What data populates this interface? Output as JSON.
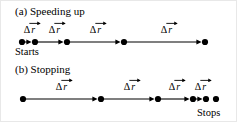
{
  "figure": {
    "width": 237,
    "height": 122,
    "background": "#ffffff",
    "stroke_color": "#000000"
  },
  "panels": [
    {
      "id": "speeding-up",
      "title": "(a) Speeding up",
      "title_x": 14,
      "title_y": 5,
      "baseline_y": 41,
      "endpoint_label": "Starts",
      "endpoint_label_x": 14,
      "endpoint_label_y": 46,
      "dots_x": [
        21,
        34,
        66,
        123,
        204
      ],
      "segments": [
        {
          "label": "Δ",
          "symbol": "r",
          "x_start": 21,
          "x_end": 34,
          "label_x": 29,
          "label_y": 24
        },
        {
          "label": "Δ",
          "symbol": "r",
          "x_start": 34,
          "x_end": 66,
          "label_x": 54,
          "label_y": 24
        },
        {
          "label": "Δ",
          "symbol": "r",
          "x_start": 66,
          "x_end": 123,
          "label_x": 95,
          "label_y": 24
        },
        {
          "label": "Δ",
          "symbol": "r",
          "x_start": 123,
          "x_end": 204,
          "label_x": 166,
          "label_y": 24
        }
      ]
    },
    {
      "id": "stopping",
      "title": "(b) Stopping",
      "title_x": 14,
      "title_y": 63,
      "baseline_y": 98,
      "endpoint_label": "Stops",
      "endpoint_label_x": 196,
      "endpoint_label_y": 107,
      "dots_x": [
        22,
        100,
        157,
        192,
        205,
        215
      ],
      "segments": [
        {
          "label": "Δ",
          "symbol": "r",
          "x_start": 22,
          "x_end": 100,
          "label_x": 61,
          "label_y": 81
        },
        {
          "label": "Δ",
          "symbol": "r",
          "x_start": 100,
          "x_end": 157,
          "label_x": 129,
          "label_y": 81
        },
        {
          "label": "Δ",
          "symbol": "r",
          "x_start": 157,
          "x_end": 192,
          "label_x": 174,
          "label_y": 81
        },
        {
          "label": "Δ",
          "symbol": "r",
          "x_start": 192,
          "x_end": 205,
          "label_x": 200,
          "label_y": 81
        }
      ]
    }
  ],
  "geometry": {
    "dot_radius": 3.1,
    "line_width": 1.1,
    "arrow_half_height": 2.6,
    "arrow_length": 5.2,
    "arrow_gap": 3.4
  }
}
